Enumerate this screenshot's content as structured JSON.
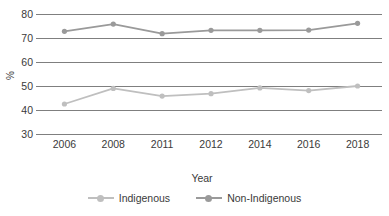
{
  "chart_data": {
    "type": "line",
    "title": "",
    "xlabel": "Year",
    "ylabel": "%",
    "categories": [
      "2006",
      "2008",
      "2011",
      "2012",
      "2014",
      "2016",
      "2018"
    ],
    "series": [
      {
        "name": "Indigenous",
        "color": "#bfbfbf",
        "values": [
          42.5,
          49.0,
          45.8,
          46.8,
          49.2,
          48.1,
          50.0
        ]
      },
      {
        "name": "Non-Indigenous",
        "color": "#9a9a9a",
        "values": [
          72.8,
          75.8,
          71.8,
          73.2,
          73.2,
          73.3,
          76.1
        ]
      }
    ],
    "ylim": [
      30,
      80
    ],
    "yticks": [
      30,
      40,
      50,
      60,
      70,
      80
    ],
    "ytick_labels": [
      "30",
      "40",
      "50",
      "60",
      "70",
      "80"
    ],
    "grid": true,
    "legend_position": "bottom",
    "gridline_color": "#7f7f7f"
  }
}
